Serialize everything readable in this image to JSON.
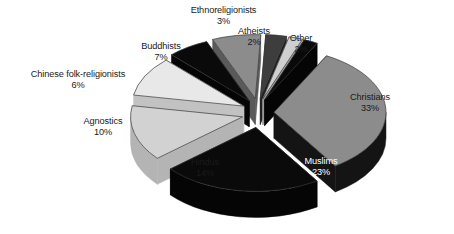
{
  "chart_data": {
    "type": "pie",
    "title": "",
    "subtitle": "",
    "xlabel": "",
    "ylabel": "",
    "legend_position": "none",
    "grid": false,
    "exploded": true,
    "three_d": true,
    "unit": "%",
    "total": 100,
    "categories": [
      "Christians",
      "Muslims",
      "Hindus",
      "Agnostics",
      "Buddhists",
      "Chinese folk-religionists",
      "Ethnoreligionists",
      "Atheists",
      "Other"
    ],
    "values": [
      33,
      23,
      14,
      10,
      7,
      6,
      3,
      2,
      2
    ],
    "slices": [
      {
        "label": "Christians",
        "value": 33,
        "pct_text": "33%",
        "color": "#8c8c8c",
        "side_color": "#141414",
        "label_placement": "inside",
        "text_color": "dark"
      },
      {
        "label": "Muslims",
        "value": 23,
        "pct_text": "23%",
        "color": "#0a0a0a",
        "side_color": "#050505",
        "label_placement": "inside",
        "text_color": "light"
      },
      {
        "label": "Hindus",
        "value": 14,
        "pct_text": "14%",
        "color": "#d2d2d2",
        "side_color": "#b4b4b4",
        "label_placement": "inside",
        "text_color": "dark"
      },
      {
        "label": "Agnostics",
        "value": 10,
        "pct_text": "10%",
        "color": "#e8e8e8",
        "side_color": "#c2c2c2",
        "label_placement": "outside",
        "text_color": "dark"
      },
      {
        "label": "Chinese folk-religionists",
        "value": 6,
        "pct_text": "6%",
        "color": "#0a0a0a",
        "side_color": "#050505",
        "label_placement": "outside",
        "text_color": "dark"
      },
      {
        "label": "Buddhists",
        "value": 7,
        "pct_text": "7%",
        "color": "#8c8c8c",
        "side_color": "#5a5a5a",
        "label_placement": "outside",
        "text_color": "dark"
      },
      {
        "label": "Ethnoreligionists",
        "value": 3,
        "pct_text": "3%",
        "color": "#3d3d3d",
        "side_color": "#1e1e1e",
        "label_placement": "outside",
        "text_color": "dark"
      },
      {
        "label": "Atheists",
        "value": 2,
        "pct_text": "2%",
        "color": "#cfcfcf",
        "side_color": "#9a9a9a",
        "label_placement": "outside",
        "text_color": "dark"
      },
      {
        "label": "Other",
        "value": 2,
        "pct_text": "2%",
        "color": "#0a0a0a",
        "side_color": "#050505",
        "label_placement": "outside",
        "text_color": "dark"
      }
    ],
    "colors": {
      "background": "#ffffff",
      "text": "#1a1a1a",
      "inside_light_text": "#ffffff",
      "gray": "#8c8c8c",
      "black": "#0a0a0a",
      "light_gray": "#d2d2d2",
      "near_white": "#e8e8e8",
      "dark_gray": "#3d3d3d"
    }
  },
  "labels": {
    "christians": {
      "name": "Christians",
      "pct": "33%"
    },
    "muslims": {
      "name": "Muslims",
      "pct": "23%"
    },
    "hindus": {
      "name": "Hindus",
      "pct": "14%"
    },
    "agnostics": {
      "name": "Agnostics",
      "pct": "10%"
    },
    "chinese_folk": {
      "name": "Chinese folk-religionists",
      "pct": "6%"
    },
    "buddhists": {
      "name": "Buddhists",
      "pct": "7%"
    },
    "ethnoreligionists": {
      "name": "Ethnoreligionists",
      "pct": "3%"
    },
    "atheists": {
      "name": "Atheists",
      "pct": "2%"
    },
    "other": {
      "name": "Other",
      "pct": "2%"
    }
  }
}
